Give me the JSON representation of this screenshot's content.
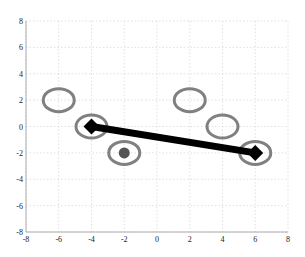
{
  "chart_data": {
    "type": "scatter",
    "title": "",
    "xlabel": "",
    "ylabel": "",
    "xlim": [
      -8,
      8
    ],
    "ylim": [
      -8,
      8
    ],
    "grid": true,
    "x_ticks": [
      -8,
      -6,
      -4,
      -2,
      0,
      2,
      4,
      6,
      8
    ],
    "y_ticks": [
      -8,
      -6,
      -4,
      -2,
      0,
      2,
      4,
      6,
      8
    ],
    "series": [
      {
        "name": "open-circles",
        "marker": "circle-open",
        "color": "#777777",
        "points": [
          [
            -6,
            2
          ],
          [
            -4,
            0
          ],
          [
            -2,
            -2
          ],
          [
            2,
            2
          ],
          [
            4,
            0
          ],
          [
            6,
            -2
          ]
        ]
      },
      {
        "name": "filled-dot",
        "marker": "circle-filled",
        "color": "#555555",
        "points": [
          [
            -2,
            -2
          ]
        ]
      },
      {
        "name": "line",
        "marker": "diamond",
        "color": "#000000",
        "points": [
          [
            -4,
            0
          ],
          [
            6,
            -2
          ]
        ]
      }
    ]
  },
  "colors": {
    "grid": "#cccccc",
    "axis": "#999999",
    "ring": "#808080",
    "dot": "#555555",
    "line": "#000000"
  }
}
